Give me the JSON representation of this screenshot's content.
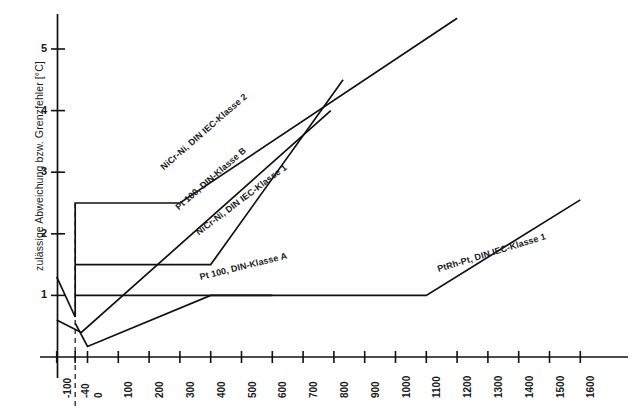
{
  "chart_data": {
    "type": "line",
    "title": "",
    "xlabel": "",
    "ylabel": "zulässige Abweichung bzw. Grenzfehler [°C]",
    "xlim": [
      -140,
      1660
    ],
    "ylim": [
      0,
      5.6
    ],
    "grid": false,
    "legend": "inline-labels",
    "xticks": [
      -100,
      -40,
      0,
      100,
      200,
      300,
      400,
      500,
      600,
      700,
      800,
      900,
      1000,
      1100,
      1200,
      1300,
      1400,
      1500,
      1600
    ],
    "xtick_labels": [
      "-100",
      "-40",
      "0",
      "100",
      "200",
      "300",
      "400",
      "500",
      "600",
      "700",
      "800",
      "900",
      "1000",
      "1100",
      "1200",
      "1300",
      "1400",
      "1500",
      "1600"
    ],
    "yticks": [
      1,
      2,
      3,
      4,
      5
    ],
    "ytick_labels": [
      "1",
      "2",
      "3",
      "4",
      "5"
    ],
    "series": [
      {
        "name": "NiCr-Ni, DIN IEC-Klasse 2",
        "label": "NiCr-Ni, DIN IEC-Klasse 2",
        "x": [
          -100,
          -40,
          -40,
          300,
          1200
        ],
        "y": [
          1.3,
          0.65,
          2.5,
          2.5,
          5.5
        ],
        "label_x": 250,
        "label_y": 3.0,
        "label_angle": -41
      },
      {
        "name": "Pt 100, DIN-Klasse B",
        "label": "Pt 100, DIN-Klasse B",
        "x": [
          -40,
          400,
          830
        ],
        "y": [
          1.5,
          1.5,
          4.5
        ],
        "label_x": 300,
        "label_y": 2.35,
        "label_angle": -41
      },
      {
        "name": "NiCr-Ni, DIN IEC-Klasse 1",
        "label": "NiCr-Ni, DIN IEC-Klasse 1",
        "x": [
          -100,
          -20,
          790
        ],
        "y": [
          0.6,
          0.4,
          4.0
        ],
        "label_x": 365,
        "label_y": 1.95,
        "label_angle": -37
      },
      {
        "name": "Pt 100, DIN-Klasse A",
        "label": "Pt 100, DIN-Klasse A",
        "x": [
          -40,
          600
        ],
        "y": [
          1.0,
          1.0
        ],
        "label_x": 370,
        "label_y": 1.22,
        "label_angle": -14
      },
      {
        "name": "PtRh-Pt, DIN IEC-Klasse 1",
        "label": "PtRh-Pt, DIN IEC-Klasse 1",
        "x": [
          -40,
          0,
          400,
          1100,
          1600
        ],
        "y": [
          0.55,
          0.17,
          1.0,
          1.0,
          2.55
        ],
        "label_x": 1140,
        "label_y": 1.35,
        "label_angle": -17
      }
    ],
    "annotations": [
      {
        "type": "dashed-vertical",
        "x": -40,
        "y0": 0.0,
        "y1": 2.5,
        "note": "-40 °C reference line"
      }
    ],
    "colors": {
      "line": "#111111",
      "axis": "#111111",
      "background": "#ffffff"
    }
  }
}
